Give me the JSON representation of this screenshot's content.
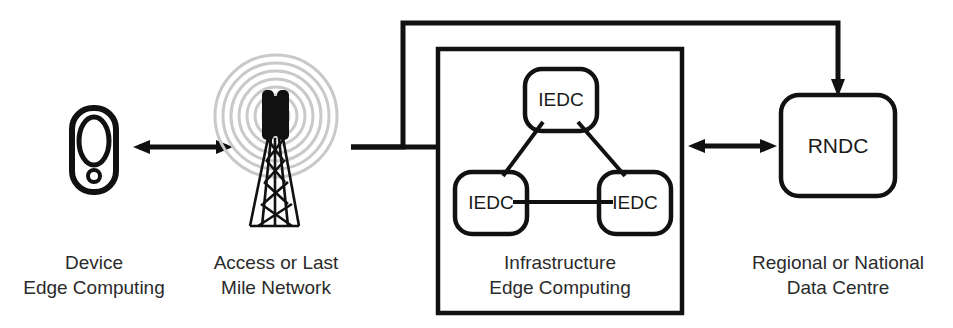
{
  "diagram": {
    "background_color": "#ffffff",
    "line_color": "#111111",
    "ring_color": "#c9c9c9",
    "text_color": "#2b2b2b"
  },
  "stages": {
    "device": {
      "icon": "mobile-device-icon",
      "label_line1": "Device",
      "label_line2": "Edge Computing"
    },
    "access": {
      "icon": "cell-tower-icon",
      "label_line1": "Access or Last",
      "label_line2": "Mile Network"
    },
    "infrastructure": {
      "label_line1": "Infrastructure",
      "label_line2": "Edge Computing",
      "nodes": [
        {
          "label": "IEDC",
          "position": "top"
        },
        {
          "label": "IEDC",
          "position": "bottom-left"
        },
        {
          "label": "IEDC",
          "position": "bottom-right"
        }
      ]
    },
    "datacentre": {
      "node_label": "RNDC",
      "label_line1": "Regional or National",
      "label_line2": "Data Centre"
    }
  },
  "connectors": [
    {
      "name": "device-to-access",
      "type": "double-arrow"
    },
    {
      "name": "access-to-infrastructure",
      "type": "line"
    },
    {
      "name": "infrastructure-to-datacentre",
      "type": "double-arrow"
    },
    {
      "name": "access-bypass-to-datacentre",
      "type": "single-arrow"
    }
  ]
}
